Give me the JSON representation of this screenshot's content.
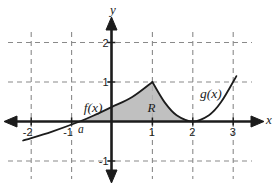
{
  "figure": {
    "background_color": "#ffffff",
    "axis_color": "#1c1c1c",
    "grid_color": "#8a8a8a",
    "text_color": "#1c1c1c",
    "region_fill_color": "#b5b5b5"
  },
  "chart_data": {
    "type": "line",
    "title": "",
    "xlabel": "x",
    "ylabel": "y",
    "xlim": [
      -2.8,
      4.1
    ],
    "ylim": [
      -1.7,
      3.05
    ],
    "grid": "dashed",
    "x_ticks": [
      {
        "value": -2,
        "label": "-2"
      },
      {
        "value": -1,
        "label": "-1"
      },
      {
        "value": 1,
        "label": "1"
      },
      {
        "value": 2,
        "label": "2"
      },
      {
        "value": 3,
        "label": "3"
      }
    ],
    "y_ticks": [
      {
        "value": -1,
        "label": "-1"
      },
      {
        "value": 1,
        "label": "1"
      },
      {
        "value": 2,
        "label": "2"
      }
    ],
    "series": [
      {
        "name": "f(x)",
        "points": [
          [
            -2.2,
            -0.48
          ],
          [
            -1.5,
            -0.26
          ],
          [
            -0.8,
            0
          ],
          [
            -0.35,
            0.2
          ],
          [
            0,
            0.37
          ],
          [
            0.5,
            0.62
          ],
          [
            1,
            1
          ]
        ]
      },
      {
        "name": "g(x)",
        "points": [
          [
            1,
            1
          ],
          [
            1.3,
            0.49
          ],
          [
            1.6,
            0.16
          ],
          [
            2,
            0
          ],
          [
            2.4,
            0.16
          ],
          [
            2.7,
            0.49
          ],
          [
            3.08,
            1.15
          ]
        ]
      }
    ],
    "region": {
      "label": "R",
      "x_start_label": "a",
      "x_start": -0.8,
      "x_end": 2,
      "upper_boundary_f": [
        [
          -0.8,
          0
        ],
        [
          -0.35,
          0.2
        ],
        [
          0,
          0.37
        ],
        [
          0.5,
          0.62
        ],
        [
          1,
          1
        ]
      ],
      "upper_boundary_g": [
        [
          1,
          1
        ],
        [
          1.3,
          0.49
        ],
        [
          1.6,
          0.16
        ],
        [
          2,
          0
        ]
      ],
      "lower_boundary": "x-axis"
    },
    "annotations": [
      {
        "text": "f(x)",
        "x": -0.47,
        "y": 0.35,
        "style": "fn-label",
        "name": "f-label"
      },
      {
        "text": "g(x)",
        "x": 2.45,
        "y": 0.72,
        "style": "fn-label",
        "name": "g-label"
      },
      {
        "text": "R",
        "x": 0.98,
        "y": 0.35,
        "style": "region-label",
        "name": "region-r-label"
      },
      {
        "text": "a",
        "x": -0.77,
        "y": -0.17,
        "style": "pt-label",
        "name": "point-a-label"
      }
    ]
  }
}
